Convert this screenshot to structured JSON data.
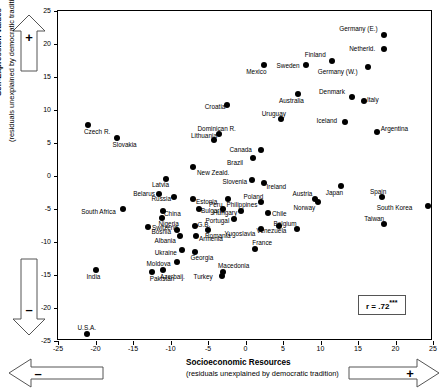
{
  "axes": {
    "y_title": "Self-Expression Values",
    "y_subtitle": "(residuals unexplained by democratic tradition)",
    "x_title": "Socioeconomic Resources",
    "x_subtitle": "(residuals unexplained by democratic tradition)",
    "y_ticks": [
      "25",
      "20",
      "15",
      "10",
      "5",
      "0",
      "-5",
      "-10",
      "-15",
      "-20",
      "-25"
    ],
    "x_ticks": [
      "-25",
      "-20",
      "-15",
      "-10",
      "-5",
      "0",
      "5",
      "10",
      "15",
      "20",
      "25"
    ],
    "y_plus_sign": "+",
    "y_minus_sign": "–",
    "x_plus_sign": "+",
    "x_minus_sign": "–"
  },
  "annotation": {
    "r_prefix": "r = .72",
    "r_stars": "***"
  },
  "chart_data": {
    "type": "scatter",
    "title": "",
    "xlabel": "Socioeconomic Resources (residuals unexplained by democratic tradition)",
    "ylabel": "Self-Expression Values (residuals unexplained by democratic tradition)",
    "xlim": [
      -25,
      25
    ],
    "ylim": [
      -25,
      25
    ],
    "grid": false,
    "legend": "r = .72***",
    "correlation": 0.72,
    "points": [
      {
        "label": "Germany (E.)",
        "x": 18.5,
        "y": 21.3,
        "lx": -45,
        "ly": -9
      },
      {
        "label": "Netherld.",
        "x": 18.5,
        "y": 19.2,
        "lx": -35,
        "ly": -3
      },
      {
        "label": "Finland",
        "x": 11.5,
        "y": 17.4,
        "lx": -27,
        "ly": -9
      },
      {
        "label": "Germany (W.)",
        "x": 16.3,
        "y": 16.5,
        "lx": -50,
        "ly": 2
      },
      {
        "label": "Sweden",
        "x": 8.0,
        "y": 16.8,
        "lx": -29,
        "ly": -2
      },
      {
        "label": "Mexico",
        "x": 2.5,
        "y": 16.8,
        "lx": -18,
        "ly": 4
      },
      {
        "label": "Denmark",
        "x": 14.2,
        "y": 12.0,
        "lx": -33,
        "ly": -8
      },
      {
        "label": "Italy",
        "x": 15.8,
        "y": 11.3,
        "lx": 3,
        "ly": -4
      },
      {
        "label": "Australia",
        "x": 7.0,
        "y": 12.5,
        "lx": -19,
        "ly": 4
      },
      {
        "label": "Croatia",
        "x": -2.5,
        "y": 10.7,
        "lx": -22,
        "ly": -1
      },
      {
        "label": "Uruguay",
        "x": 4.7,
        "y": 8.7,
        "lx": -19,
        "ly": -8
      },
      {
        "label": "Iceland",
        "x": 13.2,
        "y": 8.2,
        "lx": -28,
        "ly": -4
      },
      {
        "label": "Argentina",
        "x": 17.5,
        "y": 6.7,
        "lx": 4,
        "ly": -6
      },
      {
        "label": "Dominican R.",
        "x": -3.6,
        "y": 6.4,
        "lx": -21,
        "ly": -8
      },
      {
        "label": "Czech R.",
        "x": -21.0,
        "y": 7.8,
        "lx": -4,
        "ly": 4
      },
      {
        "label": "Lithuania",
        "x": -4.2,
        "y": 5.4,
        "lx": -23,
        "ly": -7
      },
      {
        "label": "Slovakia",
        "x": -17.2,
        "y": 5.8,
        "lx": -4,
        "ly": 4
      },
      {
        "label": "Canada",
        "x": 2.0,
        "y": 4.0,
        "lx": -31,
        "ly": -3
      },
      {
        "label": "Austria",
        "x": 9.2,
        "y": -3.5,
        "lx": -22,
        "ly": -8
      },
      {
        "label": "Japan",
        "x": 12.7,
        "y": -1.5,
        "lx": -15,
        "ly": 4
      },
      {
        "label": "Spain",
        "x": 18.2,
        "y": -3.2,
        "lx": -12,
        "ly": -8
      },
      {
        "label": "South Korea",
        "x": 24.3,
        "y": -4.5,
        "lx": -51,
        "ly": -1
      },
      {
        "label": "Brazil",
        "x": 1.0,
        "y": 2.8,
        "lx": -26,
        "ly": 2
      },
      {
        "label": "Slovenia",
        "x": 0.8,
        "y": -0.6,
        "lx": -29,
        "ly": -1
      },
      {
        "label": "Ireland",
        "x": 2.4,
        "y": -1.1,
        "lx": 3,
        "ly": 1
      },
      {
        "label": "Norway",
        "x": 9.6,
        "y": -4.0,
        "lx": -24,
        "ly": 3
      },
      {
        "label": "Taiwan",
        "x": 18.5,
        "y": -7.3,
        "lx": -20,
        "ly": -8
      },
      {
        "label": "New Zeald.",
        "x": -7.0,
        "y": 1.4,
        "lx": 4,
        "ly": 3
      },
      {
        "label": "Philippines",
        "x": -2.4,
        "y": -3.5,
        "lx": -1,
        "ly": 3
      },
      {
        "label": "Poland",
        "x": 2.0,
        "y": -4.0,
        "lx": -17,
        "ly": -8
      },
      {
        "label": "Latvia",
        "x": -10.6,
        "y": -0.5,
        "lx": -14,
        "ly": 3
      },
      {
        "label": "Peru",
        "x": -3.0,
        "y": -5.0,
        "lx": -14,
        "ly": -7
      },
      {
        "label": "Hungary",
        "x": -0.6,
        "y": -5.3,
        "lx": -28,
        "ly": -1
      },
      {
        "label": "Chile",
        "x": 3.0,
        "y": -5.6,
        "lx": 4,
        "ly": -2
      },
      {
        "label": "Belarus",
        "x": -11.5,
        "y": -2.8,
        "lx": -26,
        "ly": -3
      },
      {
        "label": "Russia",
        "x": -9.6,
        "y": -3.2,
        "lx": -22,
        "ly": -1
      },
      {
        "label": "Estonia",
        "x": -7.0,
        "y": -3.5,
        "lx": 3,
        "ly": 0
      },
      {
        "label": "Portugal",
        "x": -1.6,
        "y": -6.5,
        "lx": -28,
        "ly": -1
      },
      {
        "label": "Bulgaria",
        "x": -6.2,
        "y": -5.0,
        "lx": 2,
        "ly": -1
      },
      {
        "label": "Yugoslavia",
        "x": 2.0,
        "y": -8.0,
        "lx": -36,
        "ly": 2
      },
      {
        "label": "Venezuela",
        "x": 4.4,
        "y": -7.5,
        "lx": -22,
        "ly": 2
      },
      {
        "label": "Belgium",
        "x": 6.8,
        "y": -8.0,
        "lx": -23,
        "ly": -8
      },
      {
        "label": "South Africa",
        "x": -16.3,
        "y": -5.0,
        "lx": -42,
        "ly": 0
      },
      {
        "label": "China",
        "x": -11.0,
        "y": -5.3,
        "lx": 1,
        "ly": 0
      },
      {
        "label": "Nigeria",
        "x": -11.2,
        "y": -6.4,
        "lx": -3,
        "ly": 3
      },
      {
        "label": "G.B.",
        "x": -6.8,
        "y": -7.5,
        "lx": 3,
        "ly": -4
      },
      {
        "label": "Romania",
        "x": -5.0,
        "y": -8.2,
        "lx": -3,
        "ly": 3
      },
      {
        "label": "Bosnia",
        "x": -9.2,
        "y": -8.2,
        "lx": -25,
        "ly": -1
      },
      {
        "label": "Switzerld.",
        "x": -13.0,
        "y": -7.7,
        "lx": 4,
        "ly": -2
      },
      {
        "label": "Albania",
        "x": -8.8,
        "y": -9.1,
        "lx": -25,
        "ly": 2
      },
      {
        "label": "Armenia",
        "x": -6.6,
        "y": -9.1,
        "lx": 3,
        "ly": 0
      },
      {
        "label": "France",
        "x": 1.3,
        "y": -11.0,
        "lx": -3,
        "ly": -9
      },
      {
        "label": "Ukraine",
        "x": -8.5,
        "y": -11.2,
        "lx": -27,
        "ly": 0
      },
      {
        "label": "Georgia",
        "x": -6.8,
        "y": -11.5,
        "lx": -4,
        "ly": 3
      },
      {
        "label": "Moldova",
        "x": -9.2,
        "y": -13.0,
        "lx": -30,
        "ly": -1
      },
      {
        "label": "Macedonia",
        "x": -3.0,
        "y": -14.5,
        "lx": -5,
        "ly": -9
      },
      {
        "label": "Turkey",
        "x": -3.2,
        "y": -15.2,
        "lx": -28,
        "ly": -2
      },
      {
        "label": "Azerbaij.",
        "x": -11.0,
        "y": -14.3,
        "lx": -3,
        "ly": 4
      },
      {
        "label": "Pakistan",
        "x": -12.5,
        "y": -14.5,
        "lx": -2,
        "ly": 4
      },
      {
        "label": "India",
        "x": -20.0,
        "y": -14.3,
        "lx": -9,
        "ly": 4
      },
      {
        "label": "U.S.A.",
        "x": -21.2,
        "y": -24.0,
        "lx": -9,
        "ly": -9
      }
    ]
  }
}
